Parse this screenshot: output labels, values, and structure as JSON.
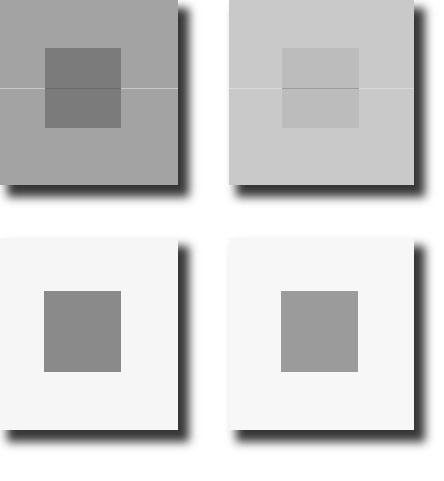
{
  "figure": {
    "background": "#ffffff",
    "shadow_color": "#141414",
    "panels": [
      {
        "id": "top-left",
        "x": 0,
        "y": 0,
        "width": 178,
        "height": 185,
        "background": "#a3a3a3",
        "has_midline": true,
        "midline_y": 88,
        "inner_square": {
          "x": 45,
          "y": 48,
          "width": 76,
          "height": 80,
          "color": "#7b7b7b"
        }
      },
      {
        "id": "top-right",
        "x": 229,
        "y": 0,
        "width": 185,
        "height": 185,
        "background": "#c9c9c9",
        "has_midline": true,
        "midline_y": 88,
        "inner_square": {
          "x": 53,
          "y": 48,
          "width": 77,
          "height": 80,
          "color": "#bcbcbc"
        }
      },
      {
        "id": "bottom-left",
        "x": 0,
        "y": 238,
        "width": 178,
        "height": 192,
        "background": "#f6f6f6",
        "has_midline": false,
        "inner_square": {
          "x": 44,
          "y": 53,
          "width": 77,
          "height": 81,
          "color": "#8a8a8a"
        }
      },
      {
        "id": "bottom-right",
        "x": 229,
        "y": 238,
        "width": 185,
        "height": 192,
        "background": "#f7f7f7",
        "has_midline": false,
        "inner_square": {
          "x": 52,
          "y": 53,
          "width": 77,
          "height": 81,
          "color": "#9b9b9b"
        }
      }
    ]
  }
}
